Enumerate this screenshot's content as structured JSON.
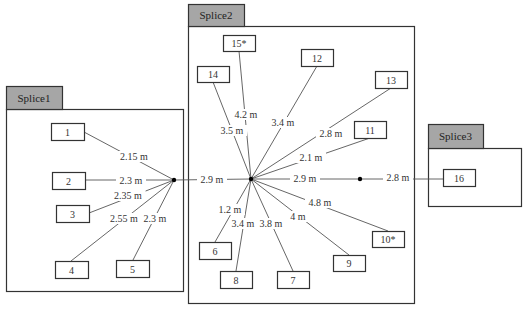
{
  "groups": [
    {
      "id": "splice1",
      "label": "Splice1",
      "tab": {
        "x": 6,
        "y": 86,
        "w": 56,
        "h": 23
      },
      "box": {
        "x": 6,
        "y": 109,
        "w": 177,
        "h": 182
      }
    },
    {
      "id": "splice2",
      "label": "Splice2",
      "tab": {
        "x": 188,
        "y": 4,
        "w": 56,
        "h": 22
      },
      "box": {
        "x": 188,
        "y": 26,
        "w": 226,
        "h": 277
      }
    },
    {
      "id": "splice3",
      "label": "Splice3",
      "tab": {
        "x": 428,
        "y": 124,
        "w": 55,
        "h": 24
      },
      "box": {
        "x": 428,
        "y": 148,
        "w": 93,
        "h": 58
      }
    }
  ],
  "hubs": [
    {
      "id": "hub1",
      "x": 174,
      "y": 180
    },
    {
      "id": "hub2",
      "x": 251,
      "y": 179
    },
    {
      "id": "hub3",
      "x": 360,
      "y": 179
    }
  ],
  "nodes": [
    {
      "label": "1",
      "x": 51,
      "y": 123,
      "w": 33,
      "h": 17
    },
    {
      "label": "2",
      "x": 52,
      "y": 172,
      "w": 33,
      "h": 17
    },
    {
      "label": "3",
      "x": 56,
      "y": 205,
      "w": 33,
      "h": 17
    },
    {
      "label": "4",
      "x": 55,
      "y": 261,
      "w": 33,
      "h": 17
    },
    {
      "label": "5",
      "x": 116,
      "y": 260,
      "w": 33,
      "h": 17
    },
    {
      "label": "15*",
      "x": 223,
      "y": 35,
      "w": 32,
      "h": 16
    },
    {
      "label": "14",
      "x": 197,
      "y": 66,
      "w": 32,
      "h": 16
    },
    {
      "label": "12",
      "x": 301,
      "y": 49,
      "w": 32,
      "h": 17
    },
    {
      "label": "13",
      "x": 375,
      "y": 71,
      "w": 32,
      "h": 17
    },
    {
      "label": "11",
      "x": 354,
      "y": 121,
      "w": 32,
      "h": 17
    },
    {
      "label": "6",
      "x": 199,
      "y": 242,
      "w": 32,
      "h": 17
    },
    {
      "label": "8",
      "x": 220,
      "y": 271,
      "w": 32,
      "h": 17
    },
    {
      "label": "7",
      "x": 277,
      "y": 271,
      "w": 32,
      "h": 17
    },
    {
      "label": "9",
      "x": 333,
      "y": 255,
      "w": 32,
      "h": 16
    },
    {
      "label": "10*",
      "x": 372,
      "y": 231,
      "w": 32,
      "h": 16
    },
    {
      "label": "16",
      "x": 443,
      "y": 169,
      "w": 32,
      "h": 17
    }
  ],
  "edges": [
    {
      "x1": 84,
      "y1": 132,
      "x2": 174,
      "y2": 180,
      "label": "2.15 m",
      "lx": 134,
      "ly": 160
    },
    {
      "x1": 85,
      "y1": 180,
      "x2": 174,
      "y2": 180,
      "label": "2.3 m",
      "lx": 131,
      "ly": 184
    },
    {
      "x1": 89,
      "y1": 213,
      "x2": 174,
      "y2": 180,
      "label": "2.35 m",
      "lx": 128,
      "ly": 199
    },
    {
      "x1": 71,
      "y1": 261,
      "x2": 174,
      "y2": 180,
      "label": "2.55 m",
      "lx": 124,
      "ly": 222
    },
    {
      "x1": 133,
      "y1": 260,
      "x2": 174,
      "y2": 180,
      "label": "2.3 m",
      "lx": 155,
      "ly": 222
    },
    {
      "x1": 174,
      "y1": 180,
      "x2": 251,
      "y2": 179,
      "label": "2.9 m",
      "lx": 212,
      "ly": 183
    },
    {
      "x1": 239,
      "y1": 51,
      "x2": 251,
      "y2": 179,
      "label": "4.2 m",
      "lx": 246,
      "ly": 118
    },
    {
      "x1": 213,
      "y1": 82,
      "x2": 251,
      "y2": 179,
      "label": "3.5 m",
      "lx": 232,
      "ly": 134
    },
    {
      "x1": 317,
      "y1": 66,
      "x2": 251,
      "y2": 179,
      "label": "3.4 m",
      "lx": 283,
      "ly": 126
    },
    {
      "x1": 391,
      "y1": 88,
      "x2": 251,
      "y2": 179,
      "label": "2.8 m",
      "lx": 331,
      "ly": 137
    },
    {
      "x1": 370,
      "y1": 138,
      "x2": 251,
      "y2": 179,
      "label": "2.1 m",
      "lx": 311,
      "ly": 161
    },
    {
      "x1": 251,
      "y1": 179,
      "x2": 360,
      "y2": 179,
      "label": "2.9 m",
      "lx": 305,
      "ly": 182
    },
    {
      "x1": 360,
      "y1": 179,
      "x2": 443,
      "y2": 179,
      "label": "2.8 m",
      "lx": 398,
      "ly": 181
    },
    {
      "x1": 251,
      "y1": 179,
      "x2": 388,
      "y2": 231,
      "label": "4.8 m",
      "lx": 320,
      "ly": 206
    },
    {
      "x1": 251,
      "y1": 179,
      "x2": 349,
      "y2": 255,
      "label": "4 m",
      "lx": 298,
      "ly": 220
    },
    {
      "x1": 251,
      "y1": 179,
      "x2": 293,
      "y2": 271,
      "label": "3.8 m",
      "lx": 271,
      "ly": 227
    },
    {
      "x1": 251,
      "y1": 179,
      "x2": 236,
      "y2": 271,
      "label": "3.4 m",
      "lx": 243,
      "ly": 227
    },
    {
      "x1": 251,
      "y1": 179,
      "x2": 215,
      "y2": 242,
      "label": "1.2 m",
      "lx": 230,
      "ly": 213
    }
  ],
  "colors": {
    "tab_fill": "#a6a6a6",
    "border": "#333333",
    "line": "#555555",
    "hub": "#000000"
  }
}
